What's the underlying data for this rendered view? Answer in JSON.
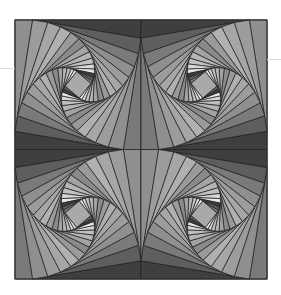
{
  "artwork": {
    "title": "",
    "description": "Four-quadrant whirling nested squares, grayscale",
    "canvas": {
      "width": 281,
      "height": 295,
      "background": "#ffffff"
    },
    "frame": {
      "x": 15,
      "y": 20,
      "width": 252,
      "height": 259,
      "stroke": "#333333"
    },
    "quadrants": [
      {
        "name": "top-left",
        "mirror": false
      },
      {
        "name": "top-right",
        "mirror": true
      },
      {
        "name": "bottom-left",
        "mirror": true
      },
      {
        "name": "bottom-right",
        "mirror": false
      }
    ],
    "spiral": {
      "steps": 14,
      "fraction": 0.14,
      "line_color": "#222222",
      "center_fill": "#a9a9a9",
      "shades": [
        "#3f3f3f",
        "#5e5e5e",
        "#7a7a7a",
        "#8f8f8f",
        "#9c9c9c",
        "#a6a6a6",
        "#b0b0b0",
        "#9a9a9a",
        "#8a8a8a",
        "#a3a3a3",
        "#b5b5b5",
        "#c0c0c0",
        "#d7d7d7",
        "#e8e8e8"
      ]
    },
    "guides": [
      {
        "x": 0,
        "y": 68,
        "width": 15
      },
      {
        "x": 267,
        "y": 59,
        "width": 14
      }
    ]
  }
}
